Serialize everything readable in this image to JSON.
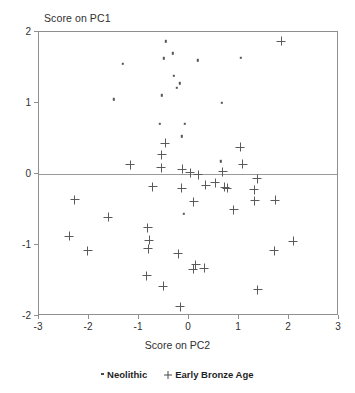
{
  "chart_data": {
    "type": "scatter",
    "title": "",
    "xlabel": "Score on PC2",
    "ylabel": "Score on PC1",
    "xlim": [
      -3,
      3
    ],
    "ylim": [
      -2,
      2
    ],
    "xticks": [
      -3,
      -2,
      -1,
      0,
      1,
      2,
      3
    ],
    "yticks": [
      -2,
      -1,
      0,
      1,
      2
    ],
    "xtick_labels": [
      "-3",
      "-2",
      "-1",
      "0",
      "1",
      "2",
      "3"
    ],
    "ytick_labels": [
      "-2",
      "-1",
      "0",
      "1",
      "2"
    ],
    "grid": false,
    "zero_line_y": 0,
    "legend_position": "below",
    "series": [
      {
        "name": "Neolithic",
        "marker": "dot",
        "color": "#555555",
        "points": [
          [
            -0.47,
            1.87
          ],
          [
            -0.32,
            1.7
          ],
          [
            -0.5,
            1.63
          ],
          [
            -1.32,
            1.55
          ],
          [
            0.18,
            1.6
          ],
          [
            1.04,
            1.64
          ],
          [
            -0.3,
            1.38
          ],
          [
            -0.19,
            1.28
          ],
          [
            -0.25,
            1.21
          ],
          [
            -0.55,
            1.11
          ],
          [
            -1.5,
            1.05
          ],
          [
            0.66,
            1.0
          ],
          [
            -0.58,
            0.71
          ],
          [
            -0.09,
            0.71
          ],
          [
            -0.15,
            0.53
          ],
          [
            0.64,
            0.18
          ],
          [
            -0.1,
            -0.56
          ]
        ]
      },
      {
        "name": "Early Bronze Age",
        "marker": "plus",
        "color": "#5a5a5a",
        "points": [
          [
            1.84,
            1.87
          ],
          [
            -0.48,
            0.43
          ],
          [
            -0.55,
            0.27
          ],
          [
            1.02,
            0.38
          ],
          [
            -1.18,
            0.13
          ],
          [
            1.07,
            0.14
          ],
          [
            -0.56,
            0.09
          ],
          [
            -0.14,
            0.07
          ],
          [
            0.02,
            0.02
          ],
          [
            0.18,
            -0.01
          ],
          [
            0.67,
            0.03
          ],
          [
            0.52,
            -0.12
          ],
          [
            1.36,
            -0.07
          ],
          [
            -0.73,
            -0.18
          ],
          [
            -0.15,
            -0.2
          ],
          [
            0.33,
            -0.16
          ],
          [
            0.71,
            -0.19
          ],
          [
            0.76,
            -0.2
          ],
          [
            1.3,
            -0.22
          ],
          [
            -2.29,
            -0.36
          ],
          [
            0.09,
            -0.39
          ],
          [
            1.31,
            -0.38
          ],
          [
            1.72,
            -0.37
          ],
          [
            0.89,
            -0.5
          ],
          [
            -1.62,
            -0.61
          ],
          [
            -0.83,
            -0.76
          ],
          [
            -2.4,
            -0.88
          ],
          [
            -0.8,
            -0.93
          ],
          [
            2.08,
            -0.95
          ],
          [
            -2.03,
            -1.08
          ],
          [
            1.7,
            -1.08
          ],
          [
            -0.82,
            -1.05
          ],
          [
            -0.22,
            -1.12
          ],
          [
            0.08,
            -1.34
          ],
          [
            0.13,
            -1.28
          ],
          [
            0.3,
            -1.33
          ],
          [
            -0.85,
            -1.43
          ],
          [
            -0.52,
            -1.58
          ],
          [
            1.37,
            -1.63
          ],
          [
            -0.18,
            -1.87
          ]
        ]
      }
    ]
  },
  "legend": {
    "items": [
      {
        "label": "Neolithic",
        "symbol": "dot-marker"
      },
      {
        "label": "Early Bronze Age",
        "symbol": "plus-marker"
      }
    ]
  }
}
